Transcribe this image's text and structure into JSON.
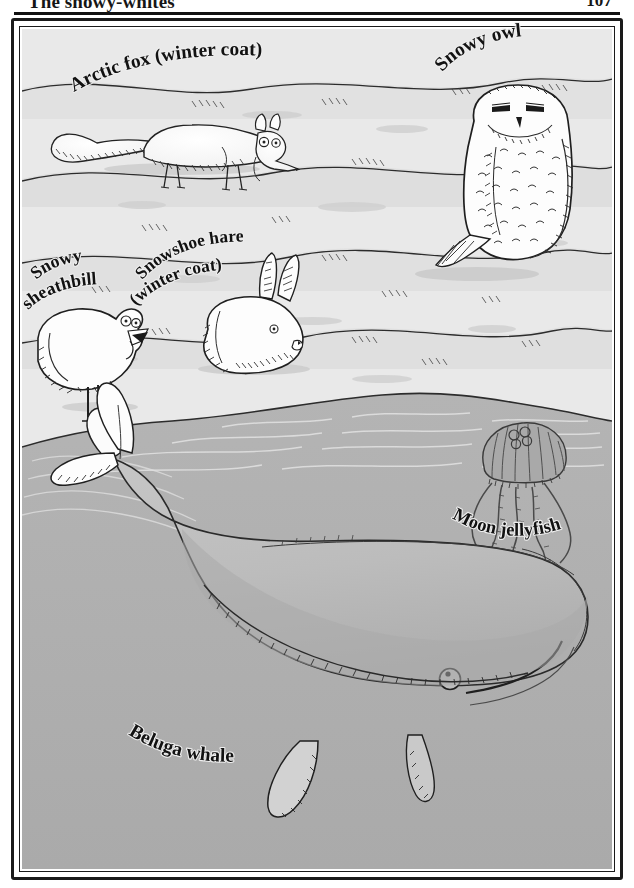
{
  "runhead": {
    "title": "The snowy-whites",
    "page_number": "107"
  },
  "palette": {
    "snow": "#e9e9e9",
    "snow_shadow": "#c9c9c9",
    "water": "#b2b2b2",
    "water_deep": "#a8a8a8",
    "animal_white": "#fdfdfd",
    "whale_body": "#bdbdbd",
    "ink": "#1a1a1a",
    "jelly": "#9a9a9a"
  },
  "labels": {
    "arctic_fox": "Arctic fox (winter coat)",
    "snowy_owl": "Snowy owl",
    "snowy_sheathbill_line1": "Snowy",
    "snowy_sheathbill_line2": "sheathbill",
    "snowshoe_hare_line1": "Snowshoe hare",
    "snowshoe_hare_line2": "(winter coat)",
    "moon_jellyfish": "Moon jellyfish",
    "beluga_whale": "Beluga whale"
  },
  "illustration": {
    "type": "ink-and-wash natural history plate",
    "scene": "polar snowfield above, open sea below",
    "subjects": [
      {
        "name": "arctic-fox",
        "label": "Arctic fox (winter coat)",
        "habitat": "snow"
      },
      {
        "name": "snowy-owl",
        "label": "Snowy owl",
        "habitat": "snow"
      },
      {
        "name": "snowy-sheathbill",
        "label": "Snowy sheathbill",
        "habitat": "snow"
      },
      {
        "name": "snowshoe-hare",
        "label": "Snowshoe hare (winter coat)",
        "habitat": "snow"
      },
      {
        "name": "moon-jellyfish",
        "label": "Moon jellyfish",
        "habitat": "water"
      },
      {
        "name": "beluga-whale",
        "label": "Beluga whale",
        "habitat": "water"
      }
    ]
  }
}
